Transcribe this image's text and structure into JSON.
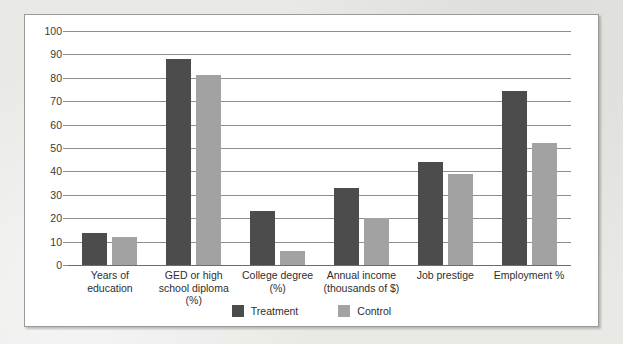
{
  "chart_data": {
    "type": "bar",
    "title": "",
    "subtitle": "",
    "xlabel": "",
    "ylabel": "",
    "ylim": [
      0,
      100
    ],
    "ytick_step": 10,
    "yticks": [
      100,
      90,
      80,
      70,
      60,
      50,
      40,
      30,
      20,
      10,
      0
    ],
    "grid": true,
    "legend_position": "bottom-center",
    "categories": [
      "Years of\neducation",
      "GED or high\nschool diploma\n(%)",
      "College degree\n(%)",
      "Annual income\n(thousands of $)",
      "Job prestige",
      "Employment %"
    ],
    "category_lines": [
      [
        "Years of",
        "education"
      ],
      [
        "GED or high",
        "school diploma",
        "(%)"
      ],
      [
        "College degree",
        "(%)"
      ],
      [
        "Annual income",
        "(thousands of $)"
      ],
      [
        "Job prestige"
      ],
      [
        "Employment %"
      ]
    ],
    "series": [
      {
        "name": "Treatment",
        "color": "#4c4c4c",
        "values": [
          13.5,
          88,
          23,
          33,
          44,
          74.5
        ]
      },
      {
        "name": "Control",
        "color": "#a2a2a2",
        "values": [
          12,
          81,
          6,
          20,
          39,
          52
        ]
      }
    ]
  },
  "legend": {
    "entries": [
      {
        "label": "Treatment",
        "color": "#4c4c4c"
      },
      {
        "label": "Control",
        "color": "#a2a2a2"
      }
    ]
  },
  "colors": {
    "treatment": "#4c4c4c",
    "control": "#a2a2a2",
    "panel_background": "#ffffff",
    "page_background": "#e9e9e6",
    "gridline": "#8e8e8e",
    "panel_border": "#9a9a9a",
    "text": "#2e2e2e"
  }
}
